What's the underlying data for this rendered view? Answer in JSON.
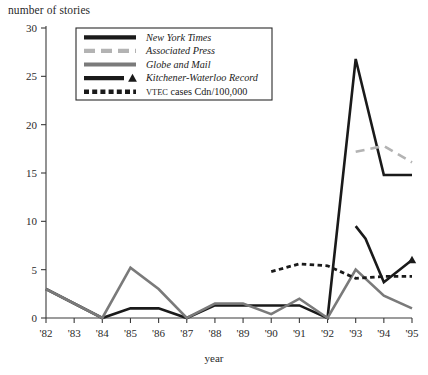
{
  "axis_title_y": "number of stories",
  "axis_title_x": "year",
  "legend": {
    "items": [
      {
        "label": "New York Times",
        "style": "solid-black",
        "color": "#1a1a1a",
        "italic": true
      },
      {
        "label": "Associated Press",
        "style": "dashed-gray",
        "color": "#b3b3b3",
        "italic": true
      },
      {
        "label": "Globe and Mail",
        "style": "solid-gray",
        "color": "#7a7a7a",
        "italic": true
      },
      {
        "label": "Kitchener-Waterloo Record",
        "style": "solid-black-triangle",
        "color": "#1a1a1a",
        "italic": true
      },
      {
        "label": "VTEC cases Cdn/100,000",
        "style": "dotted-black",
        "color": "#1a1a1a",
        "italic": false,
        "smallcaps_prefix": "VTEC",
        "rest": " cases Cdn/100,000"
      }
    ]
  },
  "chart_data": {
    "type": "line",
    "title": "",
    "xlabel": "year",
    "ylabel": "number of stories",
    "ylim": [
      0,
      30
    ],
    "yticks": [
      0,
      5,
      10,
      15,
      20,
      25,
      30
    ],
    "ytick_labels": [
      "0",
      "5",
      "10",
      "15",
      "20",
      "25",
      "30"
    ],
    "x": [
      1982,
      1983,
      1984,
      1985,
      1986,
      1987,
      1988,
      1989,
      1990,
      1991,
      1992,
      1993,
      1994,
      1995
    ],
    "xtick_labels": [
      "'82",
      "'83",
      "'84",
      "'85",
      "'86",
      "'87",
      "'88",
      "'89",
      "'90",
      "'91",
      "'92",
      "'93",
      "'94",
      "'95"
    ],
    "grid": false,
    "legend_position": "top-center",
    "series": [
      {
        "name": "New York Times",
        "color": "#1a1a1a",
        "style": "solid",
        "width": 2.6,
        "values": [
          3.0,
          1.5,
          0.0,
          1.0,
          1.0,
          0.0,
          1.3,
          1.3,
          1.3,
          1.3,
          0.0,
          26.8,
          14.8,
          14.8
        ]
      },
      {
        "name": "Associated Press",
        "color": "#b3b3b3",
        "style": "dashed",
        "width": 2.6,
        "x": [
          1993,
          1994,
          1995
        ],
        "values": [
          17.2,
          17.8,
          16.1
        ]
      },
      {
        "name": "Globe and Mail",
        "color": "#7a7a7a",
        "style": "solid",
        "width": 2.6,
        "values": [
          3.0,
          1.5,
          0.0,
          5.2,
          3.0,
          0.0,
          1.5,
          1.5,
          0.4,
          2.0,
          0.0,
          5.0,
          2.3,
          1.0
        ]
      },
      {
        "name": "Kitchener-Waterloo Record",
        "color": "#1a1a1a",
        "style": "solid-marker",
        "width": 2.6,
        "x": [
          1993,
          1993.35,
          1994,
          1995
        ],
        "values": [
          9.5,
          8.2,
          3.7,
          6.0
        ],
        "marker": "triangle",
        "marker_x": [
          1995
        ],
        "marker_values": [
          6.0
        ]
      },
      {
        "name": "VTEC cases Cdn/100,000",
        "color": "#1a1a1a",
        "style": "dotted",
        "width": 2.8,
        "x": [
          1990,
          1991,
          1992,
          1993,
          1994,
          1995
        ],
        "values": [
          4.8,
          5.6,
          5.4,
          4.1,
          4.3,
          4.3
        ]
      }
    ]
  }
}
